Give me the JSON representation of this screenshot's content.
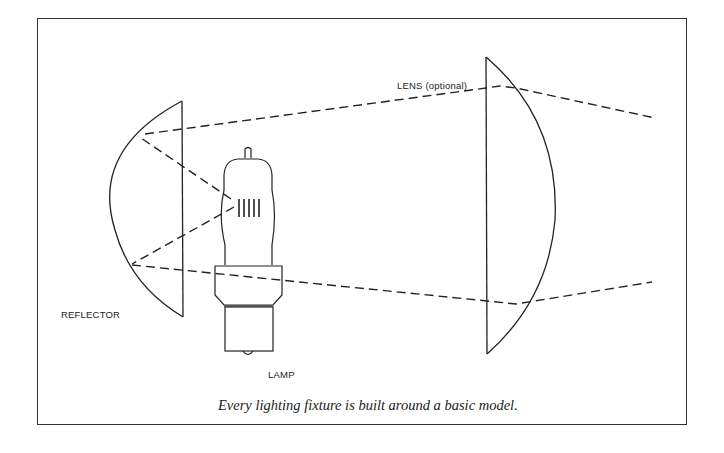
{
  "diagram": {
    "labels": {
      "lens": "LENS (optional)",
      "reflector": "REFLECTOR",
      "lamp": "LAMP"
    },
    "caption": "Every lighting fixture is built around a basic model.",
    "components": [
      {
        "name": "reflector",
        "shape": "spherical segment"
      },
      {
        "name": "lamp",
        "filament_bars": 5
      },
      {
        "name": "lens",
        "shape": "plano-convex",
        "optional": true
      }
    ],
    "rays": [
      {
        "path": "lamp filament → reflector top → lens top → beyond",
        "style": "dashed"
      },
      {
        "path": "lamp filament → reflector bottom → lens bottom → beyond",
        "style": "dashed"
      }
    ],
    "colors": {
      "line": "#222222",
      "background": "#ffffff"
    }
  }
}
